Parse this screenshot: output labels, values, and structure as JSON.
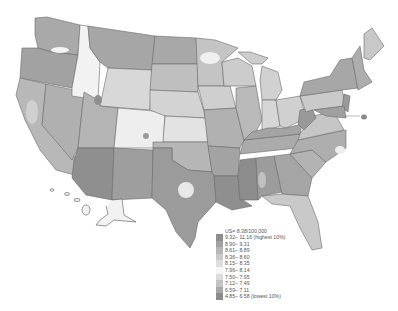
{
  "map": {
    "title": "",
    "region": "United States (with Alaska and Hawaii insets)",
    "type": "choropleth",
    "palette": {
      "lowest": "#8a8a8a",
      "low": "#a5a5a5",
      "mid": "#d7d7d7",
      "high": "#a0a0a0",
      "highest": "#8d8d8d",
      "border": "#6a6a6a",
      "background": "#ffffff"
    }
  },
  "legend": {
    "title": "US= 8.38/100,000",
    "items": [
      {
        "label": "9.32– 11.16 (highest 10%)",
        "color": "#8e8e8e"
      },
      {
        "label": "8.90– 9.31",
        "color": "#a2a2a2"
      },
      {
        "label": "8.61– 8.89",
        "color": "#b7b7b7"
      },
      {
        "label": "8.36– 8.60",
        "color": "#cacaca"
      },
      {
        "label": "8.15– 8.35",
        "color": "#dedede"
      },
      {
        "label": "7.96– 8.14",
        "color": "#f6f6f6"
      },
      {
        "label": "7.50– 7.95",
        "color": "#dcdcdc"
      },
      {
        "label": "7.12– 7.49",
        "color": "#c2c2c2"
      },
      {
        "label": "6.59– 7.11",
        "color": "#a8a8a8"
      },
      {
        "label": "4.85– 6.58 (lowest 10%)",
        "color": "#8c8c8c"
      }
    ]
  }
}
